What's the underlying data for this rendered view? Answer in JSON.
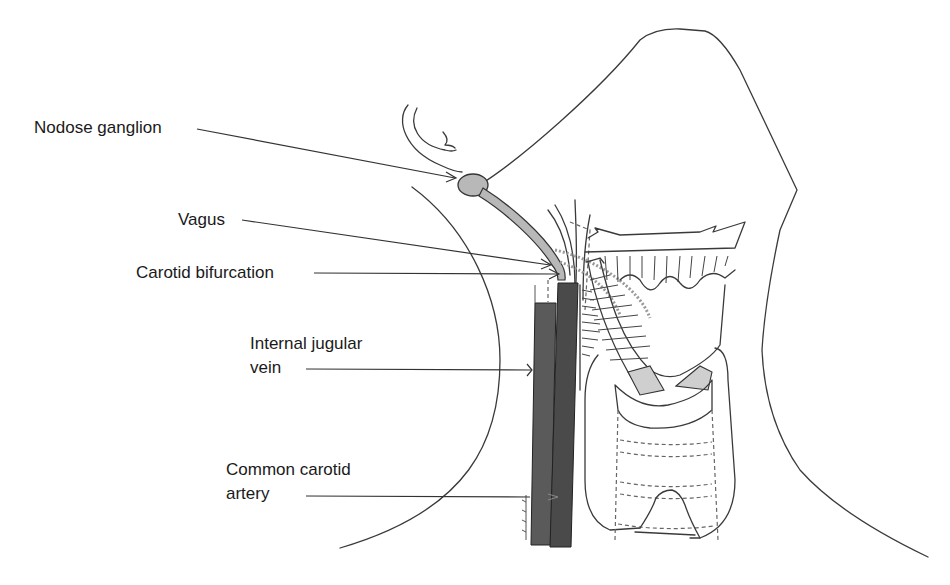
{
  "diagram": {
    "title": "",
    "colors": {
      "background": "#ffffff",
      "outline": "#3a3a3a",
      "vein": "#5a5a5a",
      "artery": "#4a4a4a",
      "nerve": "#b8b8b8"
    },
    "labels": [
      {
        "id": "nodose-ganglion",
        "lines": [
          "Nodose ganglion"
        ]
      },
      {
        "id": "vagus",
        "lines": [
          "Vagus"
        ]
      },
      {
        "id": "carotid-bifurcation",
        "lines": [
          "Carotid bifurcation"
        ]
      },
      {
        "id": "internal-jugular-vein",
        "lines": [
          "Internal jugular",
          "vein"
        ]
      },
      {
        "id": "common-carotid-artery",
        "lines": [
          "Common carotid",
          "artery"
        ]
      }
    ],
    "structures": [
      "head-outline",
      "neck-outline",
      "nodose-ganglion",
      "vagus-nerve",
      "internal-jugular-vein",
      "common-carotid-artery",
      "mandible",
      "larynx",
      "thyroid-cartilage",
      "trachea"
    ]
  }
}
